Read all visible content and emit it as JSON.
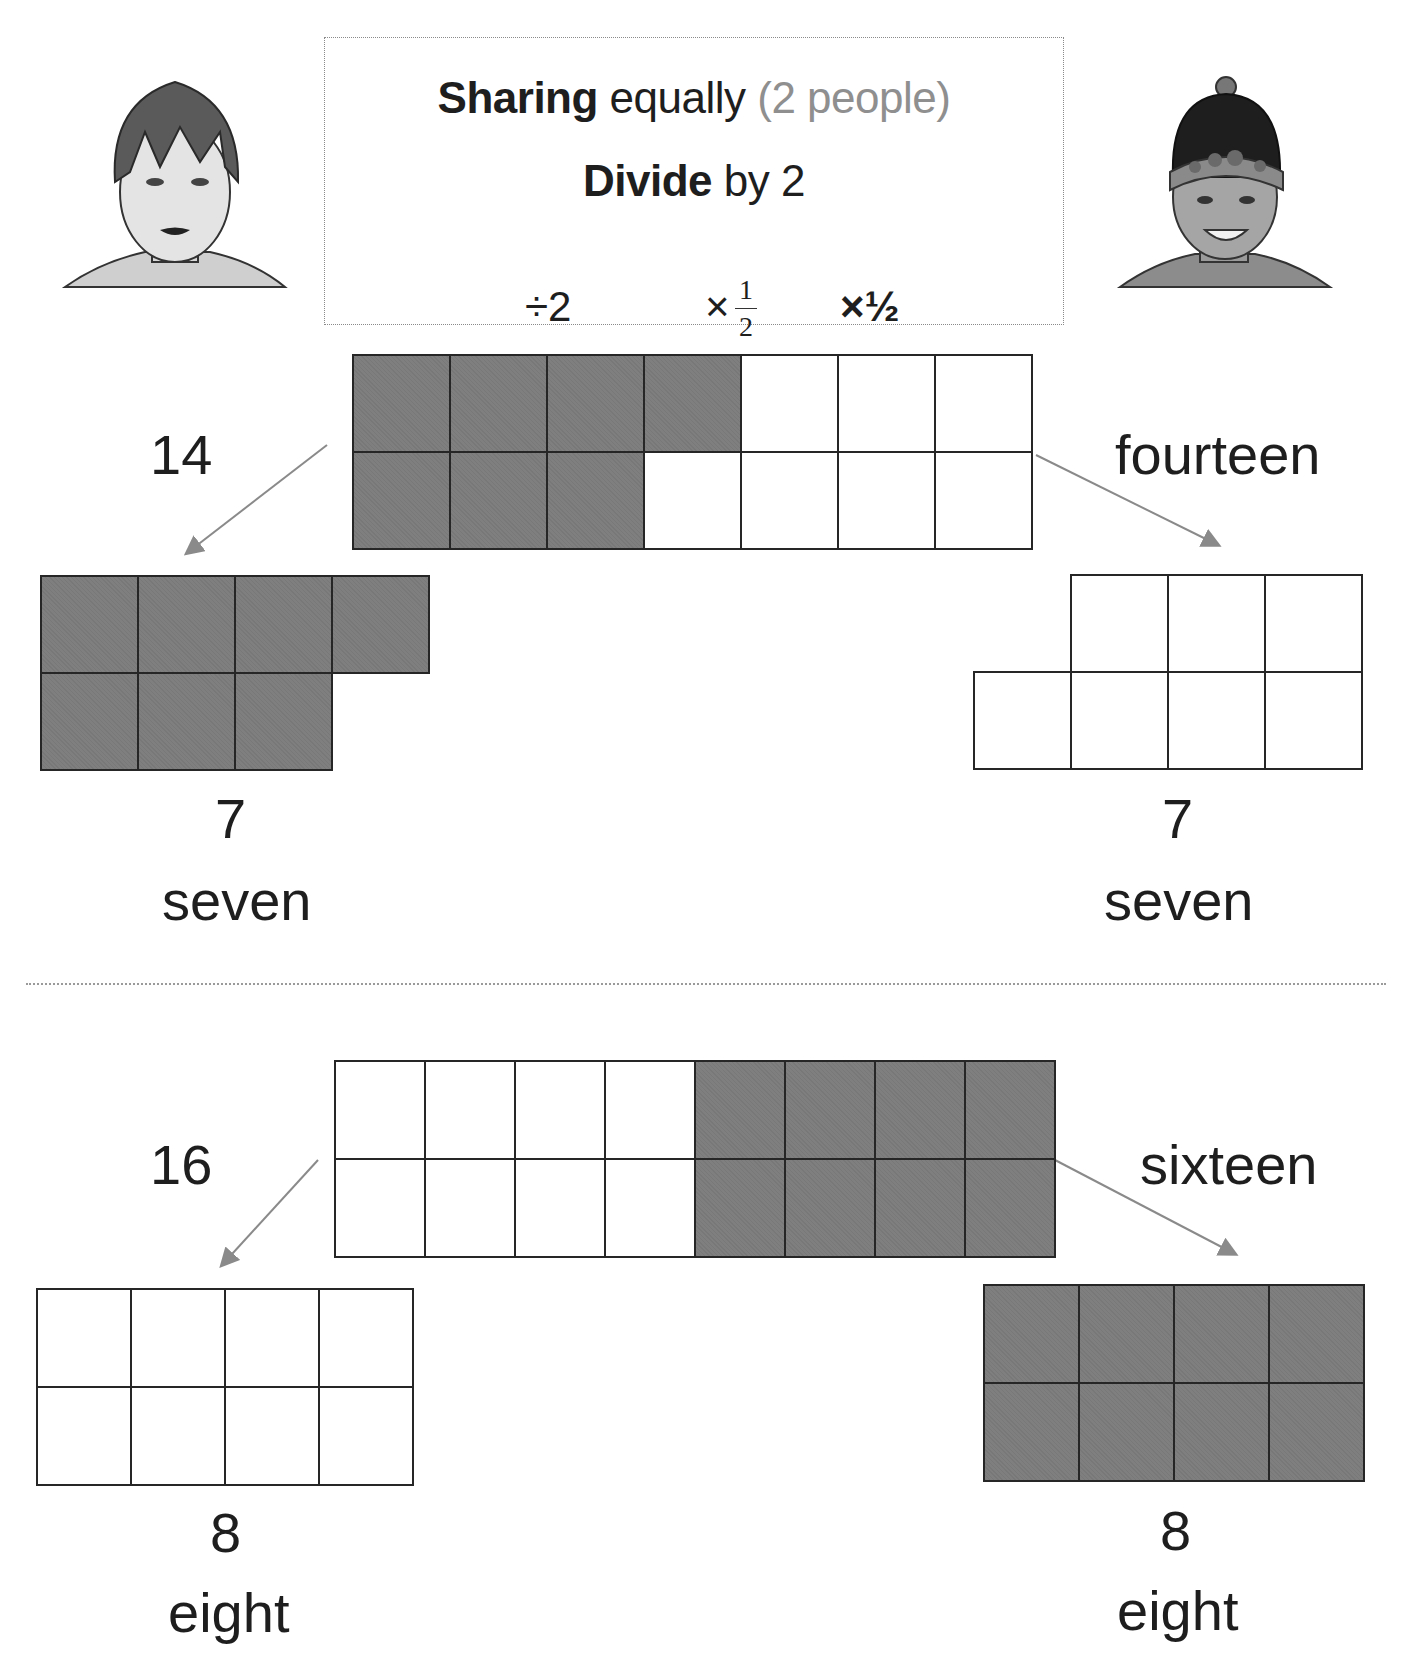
{
  "header": {
    "line1": {
      "bold": "Sharing",
      "normal": " equally ",
      "muted": "(2 people)"
    },
    "line2": {
      "bold": "Divide",
      "normal": " by 2"
    },
    "ops": {
      "divide": "÷2",
      "times_frac_sign": "×",
      "frac_num": "1",
      "frac_den": "2",
      "times_half": "×½"
    }
  },
  "avatars": {
    "left": "person-left-avatar",
    "right": "person-right-avatar"
  },
  "colors": {
    "shaded": "#7f7f7f",
    "blank": "#ffffff",
    "border": "#262626",
    "arrow": "#8a8a8a",
    "muted_text": "#8f8f8f"
  },
  "examples": [
    {
      "total_number": "14",
      "total_word": "fourteen",
      "total_grid": {
        "rows": 2,
        "cols": 7,
        "shaded_cells": 7
      },
      "left_share": {
        "number": "7",
        "word": "seven",
        "shaded": true,
        "cells": 7
      },
      "right_share": {
        "number": "7",
        "word": "seven",
        "shaded": false,
        "cells": 7
      }
    },
    {
      "total_number": "16",
      "total_word": "sixteen",
      "total_grid": {
        "rows": 2,
        "cols": 8,
        "shaded_cells": 8
      },
      "left_share": {
        "number": "8",
        "word": "eight",
        "shaded": false,
        "cells": 8
      },
      "right_share": {
        "number": "8",
        "word": "eight",
        "shaded": true,
        "cells": 8
      }
    }
  ]
}
